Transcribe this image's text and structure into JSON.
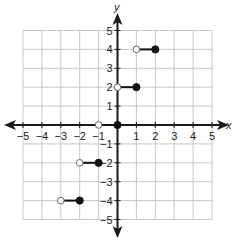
{
  "chart_data": {
    "type": "step",
    "title": "",
    "xlabel": "x",
    "ylabel": "y",
    "xlim": [
      -5,
      5
    ],
    "ylim": [
      -5,
      5
    ],
    "grid": true,
    "x_ticks": [
      -5,
      -4,
      -3,
      -2,
      -1,
      1,
      2,
      3,
      4,
      5
    ],
    "y_ticks": [
      -5,
      -4,
      -3,
      -2,
      -1,
      1,
      2,
      3,
      4,
      5
    ],
    "x_tick_labels": [
      "−5",
      "−4",
      "−3",
      "−2",
      "−1",
      "1",
      "2",
      "3",
      "4",
      "5"
    ],
    "y_tick_labels": [
      "−5",
      "−4",
      "−3",
      "−2",
      "−1",
      "1",
      "2",
      "3",
      "4",
      "5"
    ],
    "segments": [
      {
        "y": 4,
        "x_start": 1,
        "x_end": 2,
        "start_closed": false,
        "end_closed": true
      },
      {
        "y": 2,
        "x_start": 0,
        "x_end": 1,
        "start_closed": false,
        "end_closed": true
      },
      {
        "y": 0,
        "x_start": -1,
        "x_end": 0,
        "start_closed": false,
        "end_closed": true
      },
      {
        "y": -2,
        "x_start": -2,
        "x_end": -1,
        "start_closed": false,
        "end_closed": true
      },
      {
        "y": -4,
        "x_start": -3,
        "x_end": -2,
        "start_closed": false,
        "end_closed": true
      }
    ],
    "colors": {
      "grid": "#c8c8c8",
      "axis": "#1a1a1a",
      "segment": "#111111",
      "open_fill": "#ffffff"
    }
  },
  "labels": {
    "x_axis": "x",
    "y_axis": "y"
  }
}
